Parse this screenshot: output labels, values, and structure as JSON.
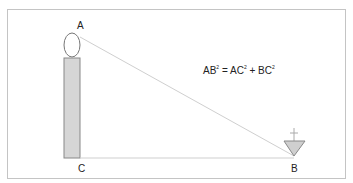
{
  "diagram": {
    "labels": {
      "a": "A",
      "b": "B",
      "c": "C"
    },
    "equation": {
      "ab": "AB",
      "eq": " = AC",
      "plus": " + BC",
      "sup": "2"
    },
    "colors": {
      "frame": "#b8b8b8",
      "body_fill": "#d4d4d4",
      "line": "#c8c8c8",
      "stroke": "#777777"
    }
  }
}
